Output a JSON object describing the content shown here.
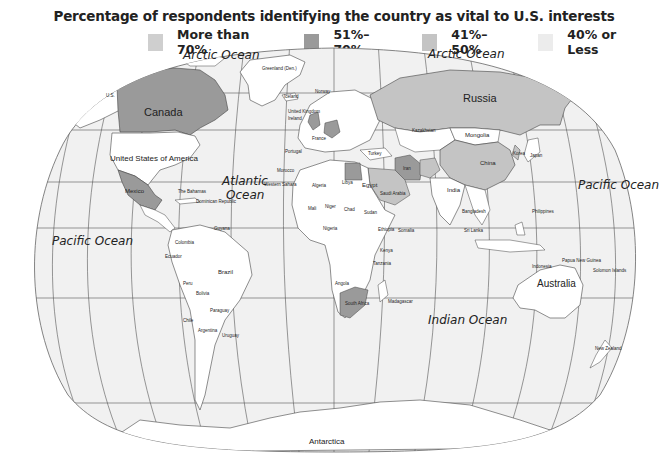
{
  "title": "Percentage of respondents identifying the country as vital to U.S. interests",
  "legend": [
    {
      "label": "More than 70%",
      "color": "#cfcfcf"
    },
    {
      "label": "51%–70%",
      "color": "#9a9a9a"
    },
    {
      "label": "41%–50%",
      "color": "#c0c0c0"
    },
    {
      "label": "40% or Less",
      "color": "#ececec"
    }
  ],
  "colors": {
    "land_default": "#ffffff",
    "ocean": "#f1f1f1",
    "grid": "#555555",
    "border": "#444444",
    "band_51_70": "#9a9a9a",
    "band_41_50": "#c4c4c4"
  },
  "oceans": {
    "arctic_west": "Arctic Ocean",
    "arctic_east": "Arctic Ocean",
    "atlantic": "Atlantic\nOcean",
    "atlantic_line1": "Atlantic",
    "atlantic_line2": "Ocean",
    "pacific_west": "Pacific Ocean",
    "pacific_east": "Pacific Ocean",
    "indian": "Indian Ocean"
  },
  "countries_major": {
    "canada": "Canada",
    "usa": "United States of America",
    "russia": "Russia",
    "china": "China",
    "mongolia": "Mongolia",
    "australia": "Australia",
    "antarctica": "Antarctica",
    "brazil": "Brazil",
    "india": "India",
    "mexico": "Mexico",
    "greenland": "Greenland (Den.)",
    "south_africa": "South Africa",
    "saudi_arabia": "Saudi Arabia",
    "egypt": "Egypt",
    "iran": "Iran",
    "japan": "Japan",
    "korea": "Korea",
    "us_alaska": "U.S."
  },
  "countries_minor": {
    "iceland": "Iceland",
    "norway": "Norway",
    "sweden": "Sweden",
    "uk": "United Kingdom",
    "ireland": "Ireland",
    "france": "France",
    "portugal": "Portugal",
    "germany": "Germany",
    "poland": "Poland",
    "ukraine": "Ukraine",
    "turkey": "Turkey",
    "kazakhstan": "Kazakhstan",
    "afghanistan": "Afghanistan",
    "pakistan": "Pakistan",
    "israel": "Israel",
    "lebanon": "Lebanon",
    "kuwait": "Kuwait",
    "oman": "Oman",
    "morocco": "Morocco",
    "western_sahara": "Western Sahara",
    "algeria": "Algeria",
    "libya": "Libya",
    "mauritania": "Mauritania",
    "senegal": "Senegal",
    "gambia": "Gambia",
    "guinea_bissau": "Guinea Bissau",
    "guinea": "Guinea",
    "sierra_leone": "Sierra Leone",
    "liberia": "Liberia",
    "ivory_coast": "Ivory Coast",
    "ghana": "Ghana",
    "togo": "Togo",
    "benin": "Benin",
    "mali": "Mali",
    "niger": "Niger",
    "nigeria": "Nigeria",
    "chad": "Chad",
    "sudan": "Sudan",
    "ethiopia": "Ethiopia",
    "somalia": "Somalia",
    "car": "Central African Republic",
    "cameroon": "Cameroon",
    "congo": "Congo",
    "gabon": "Gabon",
    "rwanda": "Rwanda",
    "burundi": "Burundi",
    "kenya": "Kenya",
    "tanzania": "Tanzania",
    "angola": "Angola",
    "zambia": "Zambia",
    "malawi": "Malawi",
    "mozambique": "Mozambique",
    "zimbabwe": "Zimbabwe",
    "namibia": "Namibia",
    "botswana": "Botswana",
    "madagascar": "Madagascar",
    "lesotho": "Lesotho",
    "nepal": "Nepal",
    "bhutan": "Bhutan",
    "bangladesh": "Bangladesh",
    "sri_lanka": "Sri Lanka",
    "myanmar": "Myanmar",
    "vietnam": "Vietnam",
    "cambodia": "Cambodia",
    "malaysia": "Malaysia",
    "brunei": "Brunei",
    "singapore": "Singapore",
    "indonesia": "Indonesia",
    "philippines": "Philippines",
    "taiwan": "Taiwan",
    "hong_kong": "Hong Kong",
    "papua_new_guinea": "Papua New Guinea",
    "solomon_islands": "Solomon Islands",
    "new_zealand": "New Zealand",
    "bahamas": "The Bahamas",
    "cuba": "Cuba",
    "haiti": "Haiti",
    "dominican_republic": "Dominican Republic",
    "puerto_rico": "Puerto Rico (US)",
    "belize": "Belize",
    "honduras": "Honduras",
    "guatemala": "Guatemala",
    "el_salvador": "El Salvador",
    "nicaragua": "Nicaragua",
    "costa_rica": "Costa Rica",
    "panama": "Panama",
    "colombia": "Colombia",
    "venezuela": "Venezuela",
    "guyana": "Guyana",
    "suriname": "Suriname",
    "french_guiana": "French Guiana (France)",
    "ecuador": "Ecuador",
    "peru": "Peru",
    "bolivia": "Bolivia",
    "chile": "Chile",
    "argentina": "Argentina",
    "paraguay": "Paraguay",
    "uruguay": "Uruguay",
    "lithuania": "Lithuania",
    "latvia": "Latvia"
  }
}
